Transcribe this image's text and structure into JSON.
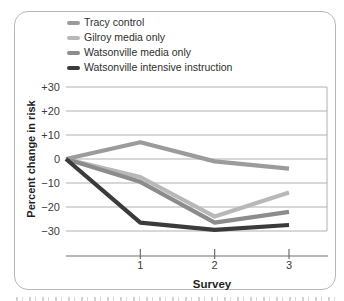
{
  "figure": {
    "ylabel": "Percent change in risk",
    "xlabel": "Survey"
  },
  "legend": {
    "items": [
      {
        "label": "Tracy control",
        "color": "#9b9b9b"
      },
      {
        "label": "Gilroy media only",
        "color": "#b8b8b8"
      },
      {
        "label": "Watsonville media only",
        "color": "#8c8c8c"
      },
      {
        "label": "Watsonville intensive instruction",
        "color": "#3b3b3b"
      }
    ]
  },
  "chart_data": {
    "type": "line",
    "x": [
      0,
      1,
      2,
      3
    ],
    "x_tick_labels": [
      "",
      "1",
      "2",
      "3"
    ],
    "series": [
      {
        "name": "Tracy control",
        "color": "#9b9b9b",
        "values": [
          0,
          7,
          -1,
          -4
        ]
      },
      {
        "name": "Gilroy media only",
        "color": "#b8b8b8",
        "values": [
          0,
          -7.5,
          -24,
          -14
        ]
      },
      {
        "name": "Watsonville media only",
        "color": "#8c8c8c",
        "values": [
          0,
          -9.5,
          -26.5,
          -22
        ]
      },
      {
        "name": "Watsonville intensive instruction",
        "color": "#3b3b3b",
        "values": [
          0,
          -26.5,
          -29.5,
          -27.5
        ]
      }
    ],
    "title": "",
    "xlabel": "Survey",
    "ylabel": "Percent change in risk",
    "ylim": [
      -30,
      30
    ],
    "y_ticks": [
      30,
      20,
      10,
      0,
      -10,
      -20,
      -30
    ],
    "y_tick_labels": [
      "+30",
      "+20",
      "+10",
      "0",
      "−10",
      "−20",
      "−30"
    ],
    "grid": "horizontal",
    "legend_position": "top-left",
    "axis_color": "#6e6e6e",
    "gridline_color": "#b0b0b0"
  }
}
